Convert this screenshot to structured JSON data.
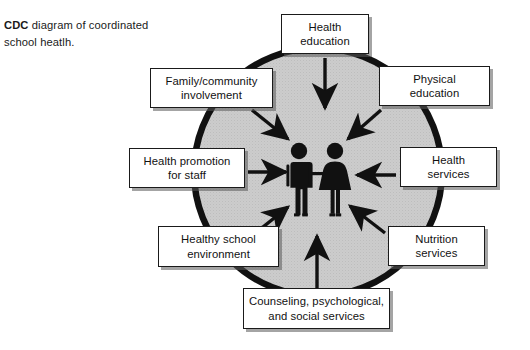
{
  "caption": {
    "lead": "CDC",
    "rest": " diagram of coordinated school heatlh."
  },
  "diagram": {
    "center": {
      "figure_left_name": "male-figure-icon",
      "figure_right_name": "female-figure-icon",
      "circle_fill": "#c9c9c9",
      "circle_stroke": "#111111"
    },
    "nodes": [
      {
        "id": "health-education",
        "line1": "Health",
        "line2": "education",
        "arrow": "down"
      },
      {
        "id": "physical-education",
        "line1": "Physical",
        "line2": "education",
        "arrow": "diagonal-down-left"
      },
      {
        "id": "health-services",
        "line1": "Health",
        "line2": "services",
        "arrow": "left"
      },
      {
        "id": "nutrition-services",
        "line1": "Nutrition",
        "line2": "services",
        "arrow": "diagonal-up-left"
      },
      {
        "id": "counseling",
        "line1": "Counseling, psychological,",
        "line2": "and social services",
        "arrow": "up"
      },
      {
        "id": "healthy-school",
        "line1": "Healthy school",
        "line2": "environment",
        "arrow": "diagonal-up-right"
      },
      {
        "id": "health-promotion",
        "line1": "Health promotion",
        "line2": "for staff",
        "arrow": "right"
      },
      {
        "id": "family-community",
        "line1": "Family/community",
        "line2": "involvement",
        "arrow": "diagonal-down-right"
      }
    ]
  }
}
